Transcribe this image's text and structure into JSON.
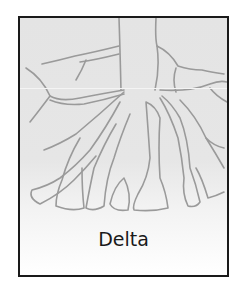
{
  "diagram": {
    "title": "Delta",
    "colors": {
      "border": "#1a1a1a",
      "channel_stroke": "#9a9a9a",
      "background_top": "#e4e4e4",
      "background_bottom": "#ffffff",
      "label": "#1a1a1a"
    }
  }
}
